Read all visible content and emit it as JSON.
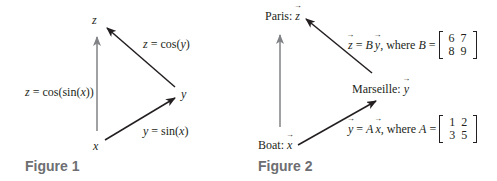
{
  "figure1": {
    "caption": "Figure 1",
    "nodes": {
      "x": "x",
      "y": "y",
      "z": "z"
    },
    "edges": {
      "x_to_y": {
        "lhs": "y",
        "eq": " = sin(",
        "arg": "x",
        "close": ")"
      },
      "y_to_z": {
        "lhs": "z",
        "eq": " = cos(",
        "arg": "y",
        "close": ")"
      },
      "x_to_z": {
        "lhs": "z",
        "eq": " = cos(sin(",
        "arg": "x",
        "close": "))"
      }
    },
    "colors": {
      "direct_arrow": "#231f20",
      "composite_arrow": "#808285"
    }
  },
  "figure2": {
    "caption": "Figure 2",
    "nodes": {
      "boat": {
        "label": "Boat: ",
        "var": "x"
      },
      "marseille": {
        "label": "Marseille: ",
        "var": "y"
      },
      "paris": {
        "label": "Paris: ",
        "var": "z"
      }
    },
    "edges": {
      "boat_to_marseille": {
        "lhs": "y",
        "eq": " = ",
        "mat": "A",
        "arg": "x",
        "where": ", where ",
        "mat2": "A",
        "eq2": " =",
        "matrix": [
          [
            "1",
            "2"
          ],
          [
            "3",
            "5"
          ]
        ]
      },
      "marseille_to_paris": {
        "lhs": "z",
        "eq": " = ",
        "mat": "B",
        "arg": "y",
        "where": ", where ",
        "mat2": "B",
        "eq2": " =",
        "matrix": [
          [
            "6",
            "7"
          ],
          [
            "8",
            "9"
          ]
        ]
      }
    },
    "colors": {
      "direct_arrow": "#231f20",
      "composite_arrow": "#808285"
    }
  }
}
